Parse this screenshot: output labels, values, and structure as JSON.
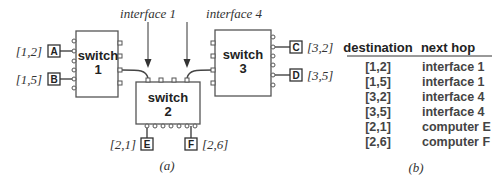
{
  "diagram": {
    "caption": "(a)",
    "interfaces": [
      {
        "id": "if1",
        "label": "interface 1"
      },
      {
        "id": "if4",
        "label": "interface 4"
      }
    ],
    "switches": [
      {
        "id": "s1",
        "name": "switch",
        "number": "1"
      },
      {
        "id": "s2",
        "name": "switch",
        "number": "2"
      },
      {
        "id": "s3",
        "name": "switch",
        "number": "3"
      }
    ],
    "computers": [
      {
        "id": "A",
        "label": "A",
        "address": "[1,2]"
      },
      {
        "id": "B",
        "label": "B",
        "address": "[1,5]"
      },
      {
        "id": "C",
        "label": "C",
        "address": "[3,2]"
      },
      {
        "id": "D",
        "label": "D",
        "address": "[3,5]"
      },
      {
        "id": "E",
        "label": "E",
        "address": "[2,1]"
      },
      {
        "id": "F",
        "label": "F",
        "address": "[2,6]"
      }
    ]
  },
  "forwarding_table": {
    "caption": "(b)",
    "headers": [
      "destination",
      "next hop"
    ],
    "rows": [
      [
        "[1,2]",
        "interface 1"
      ],
      [
        "[1,5]",
        "interface 1"
      ],
      [
        "[3,2]",
        "interface 4"
      ],
      [
        "[3,5]",
        "interface 4"
      ],
      [
        "[2,1]",
        "computer E"
      ],
      [
        "[2,6]",
        "computer F"
      ]
    ]
  }
}
